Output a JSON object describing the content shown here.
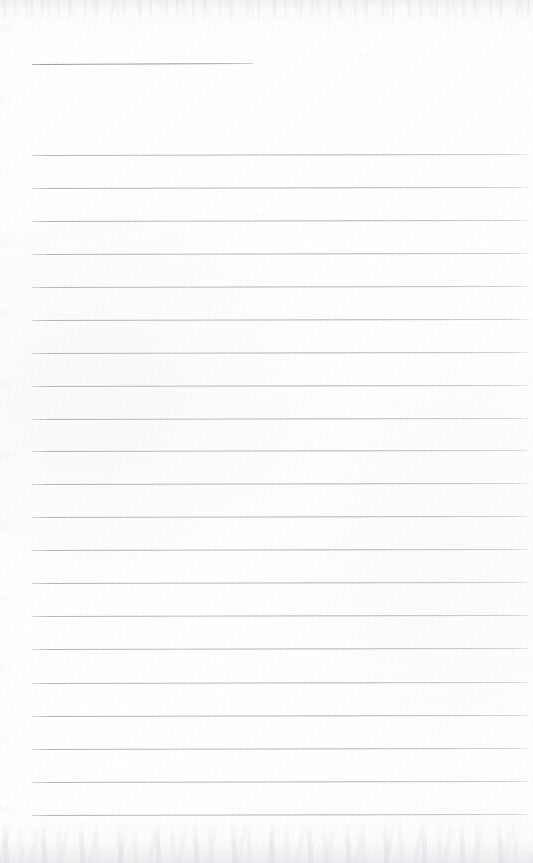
{
  "document": {
    "kind": "scanned-blank-lined-page",
    "title": "",
    "body_text": "",
    "page_width": 533,
    "page_height": 863,
    "has_handwriting": false,
    "is_blank": true
  },
  "colors": {
    "paper": "#fefefe",
    "rule": "#b0b4ba",
    "rule_header": "#989ea6",
    "scan_edge_noise": "#dcdfe3"
  },
  "ruling": {
    "left_margin_x": 32,
    "right_edge_x": 528,
    "line_spacing": 33,
    "tilt_degrees": -0.12,
    "header_rule": {
      "label": "header-rule",
      "x": 32,
      "y": 64,
      "width": 221,
      "tilt_degrees": -0.26
    },
    "lines": [
      {
        "label": "rule-1",
        "y": 155,
        "x": 32,
        "width": 496
      },
      {
        "label": "rule-2",
        "y": 188,
        "x": 32,
        "width": 496
      },
      {
        "label": "rule-3",
        "y": 221,
        "x": 32,
        "width": 496
      },
      {
        "label": "rule-4",
        "y": 254,
        "x": 32,
        "width": 496
      },
      {
        "label": "rule-5",
        "y": 287,
        "x": 32,
        "width": 496
      },
      {
        "label": "rule-6",
        "y": 320,
        "x": 32,
        "width": 496
      },
      {
        "label": "rule-7",
        "y": 353,
        "x": 32,
        "width": 496
      },
      {
        "label": "rule-8",
        "y": 386,
        "x": 32,
        "width": 496
      },
      {
        "label": "rule-9",
        "y": 419,
        "x": 32,
        "width": 496
      },
      {
        "label": "rule-10",
        "y": 451,
        "x": 32,
        "width": 496
      },
      {
        "label": "rule-11",
        "y": 484,
        "x": 32,
        "width": 496
      },
      {
        "label": "rule-12",
        "y": 517,
        "x": 32,
        "width": 496
      },
      {
        "label": "rule-13",
        "y": 550,
        "x": 32,
        "width": 496
      },
      {
        "label": "rule-14",
        "y": 583,
        "x": 32,
        "width": 496
      },
      {
        "label": "rule-15",
        "y": 616,
        "x": 32,
        "width": 496
      },
      {
        "label": "rule-16",
        "y": 649,
        "x": 32,
        "width": 496
      },
      {
        "label": "rule-17",
        "y": 683,
        "x": 32,
        "width": 496
      },
      {
        "label": "rule-18",
        "y": 716,
        "x": 32,
        "width": 496
      },
      {
        "label": "rule-19",
        "y": 749,
        "x": 32,
        "width": 496
      },
      {
        "label": "rule-20",
        "y": 782,
        "x": 32,
        "width": 496
      },
      {
        "label": "rule-21",
        "y": 815,
        "x": 32,
        "width": 496
      }
    ]
  }
}
